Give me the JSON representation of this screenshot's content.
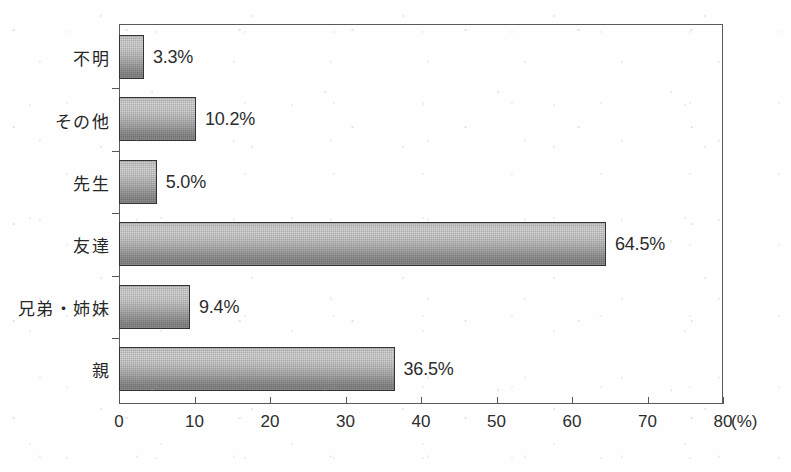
{
  "chart_data": {
    "type": "bar",
    "orientation": "horizontal",
    "title": "",
    "subtitle": "",
    "xlabel": "(%)",
    "ylabel": "",
    "xlim": [
      0,
      80
    ],
    "xticks": [
      0,
      10,
      20,
      30,
      40,
      50,
      60,
      70,
      80
    ],
    "xtick_labels": [
      "0",
      "10",
      "20",
      "30",
      "40",
      "50",
      "60",
      "70",
      "80"
    ],
    "grid": false,
    "legend": false,
    "categories": [
      "不明",
      "その他",
      "先生",
      "友達",
      "兄弟・姉妹",
      "親"
    ],
    "values": [
      3.3,
      10.2,
      5.0,
      64.5,
      9.4,
      36.5
    ],
    "value_labels": [
      "3.3%",
      "10.2%",
      "5.0%",
      "64.5%",
      "9.4%",
      "36.5%"
    ],
    "bar_style": {
      "fill": "gradient-grey-dither",
      "border_color": "#333333",
      "top_color": "#d8d8d8",
      "bottom_color": "#8a8a8a"
    },
    "axis_color": "#5a5a5a",
    "background": "#fefefe"
  }
}
